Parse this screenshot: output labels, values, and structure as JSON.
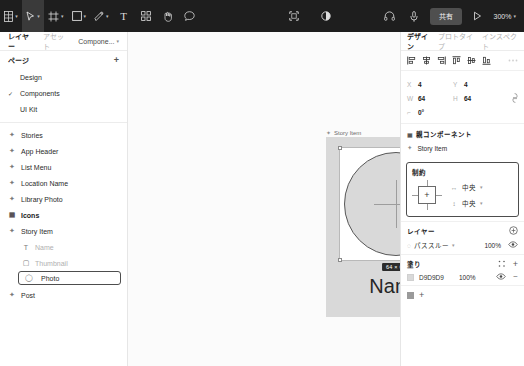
{
  "toolbar": {
    "tools": [
      {
        "name": "figma-logo-icon",
        "label": "",
        "caret": true,
        "active": false
      },
      {
        "name": "move-tool-icon",
        "label": "",
        "caret": true,
        "active": true
      },
      {
        "name": "frame-tool-icon",
        "label": "",
        "caret": true,
        "active": false
      },
      {
        "name": "shape-tool-icon",
        "label": "",
        "caret": true,
        "active": false
      },
      {
        "name": "pen-tool-icon",
        "label": "",
        "caret": true,
        "active": false
      },
      {
        "name": "text-tool-icon",
        "label": "T",
        "caret": false,
        "active": false
      },
      {
        "name": "component-tool-icon",
        "label": "",
        "caret": false,
        "active": false
      },
      {
        "name": "hand-tool-icon",
        "label": "",
        "caret": false,
        "active": false
      },
      {
        "name": "comment-tool-icon",
        "label": "",
        "caret": false,
        "active": false
      }
    ],
    "center": [
      {
        "name": "resize-to-fit-icon"
      },
      {
        "name": "contrast-icon"
      }
    ],
    "right": {
      "headphones_icon": "headphones-icon",
      "microphone_icon": "microphone-icon",
      "share_label": "共有",
      "present_icon": "play-icon",
      "zoom_level": "300%"
    }
  },
  "left_panel": {
    "tabs": [
      {
        "label": "レイヤー",
        "active": true
      },
      {
        "label": "アセット",
        "active": false
      }
    ],
    "file_dropdown": "Compone...",
    "pages_title": "ページ",
    "pages": [
      {
        "label": "Design",
        "checked": false
      },
      {
        "label": "Components",
        "checked": true
      },
      {
        "label": "UI Kit",
        "checked": false
      }
    ],
    "layers": [
      {
        "label": "Stories",
        "icon": "component-diamond-icon",
        "indent": 0,
        "bold": false,
        "muted": false,
        "selected": false
      },
      {
        "label": "App Header",
        "icon": "component-diamond-icon",
        "indent": 0,
        "bold": false,
        "muted": false,
        "selected": false
      },
      {
        "label": "List Menu",
        "icon": "component-diamond-icon",
        "indent": 0,
        "bold": false,
        "muted": false,
        "selected": false
      },
      {
        "label": "Location Name",
        "icon": "component-diamond-icon",
        "indent": 0,
        "bold": false,
        "muted": false,
        "selected": false
      },
      {
        "label": "Library Photo",
        "icon": "component-diamond-icon",
        "indent": 0,
        "bold": false,
        "muted": false,
        "selected": false
      },
      {
        "label": "Icons",
        "icon": "grid-icon",
        "indent": 0,
        "bold": true,
        "muted": false,
        "selected": false
      },
      {
        "label": "Story Item",
        "icon": "component-diamond-icon",
        "indent": 0,
        "bold": false,
        "muted": false,
        "selected": false
      },
      {
        "label": "Name",
        "icon": "text-layer-icon",
        "indent": 1,
        "bold": false,
        "muted": true,
        "selected": false
      },
      {
        "label": "Thumbnail",
        "icon": "frame-layer-icon",
        "indent": 1,
        "bold": false,
        "muted": true,
        "selected": false
      },
      {
        "label": "Photo",
        "icon": "ellipse-layer-icon",
        "indent": 1,
        "bold": false,
        "muted": false,
        "selected": true
      },
      {
        "label": "Post",
        "icon": "component-diamond-icon",
        "indent": 0,
        "bold": false,
        "muted": false,
        "selected": false
      }
    ]
  },
  "canvas": {
    "frame_label": "Story Item",
    "size_badge": "64 × 64",
    "card_text": "Name",
    "frame_fill": "#D9D9D9"
  },
  "right_panel": {
    "tabs": [
      {
        "label": "デザイン",
        "active": true
      },
      {
        "label": "プロトタイプ",
        "active": false
      },
      {
        "label": "インスペクト",
        "active": false
      }
    ],
    "align_icons": [
      "align-left-icon",
      "align-horizontal-center-icon",
      "align-right-icon",
      "align-top-icon",
      "align-vertical-center-icon",
      "align-bottom-icon",
      "more-options-icon"
    ],
    "position": {
      "x_key": "X",
      "x_value": "4",
      "y_key": "Y",
      "y_value": "4",
      "w_key": "W",
      "w_value": "64",
      "h_key": "H",
      "h_value": "64",
      "rotation_key": "⌐",
      "rotation_value": "0°",
      "lock_icon": "lock-aspect-ratio-icon"
    },
    "parent_component": {
      "title": "親コンポーネント",
      "name": "Story Item"
    },
    "constraints": {
      "title": "制約",
      "horizontal": "中央",
      "vertical": "中央"
    },
    "layer_section": {
      "title": "レイヤー",
      "blend_mode": "パススルー",
      "opacity": "100%",
      "visibility_icon": "eye-icon",
      "reset_icon": "layer-settings-icon"
    },
    "fill_section": {
      "title": "塗り",
      "color_hex": "D9D9D9",
      "opacity": "100%",
      "visibility_icon": "eye-icon",
      "remove_icon": "minus-icon",
      "styles_icon": "style-grid-icon",
      "add_icon": "plus-icon"
    },
    "stroke_section": {
      "icon": "stroke-swatch-icon",
      "add_icon": "plus-icon"
    }
  }
}
